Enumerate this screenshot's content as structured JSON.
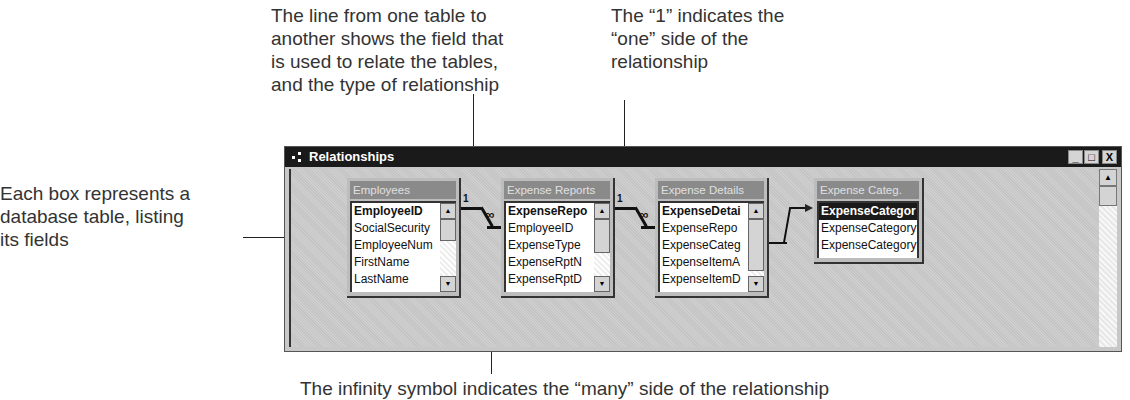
{
  "callouts": {
    "line_field": [
      "The line from one table to",
      "another shows the field that",
      "is used to relate the tables,",
      "and the type of relationship"
    ],
    "one_side": [
      "The “1” indicates the",
      "“one” side of the",
      "relationship"
    ],
    "box_table": [
      "Each box represents a",
      "database table, listing",
      "its fields"
    ],
    "infinity": "The infinity symbol indicates the “many” side of the relationship"
  },
  "window": {
    "title": "Relationships",
    "icon": "relationships-icon",
    "buttons": {
      "minimize": "_",
      "maximize": "□",
      "close": "X"
    }
  },
  "tables": [
    {
      "title": "Employees",
      "fields": [
        "EmployeeID",
        "SocialSecurity",
        "EmployeeNum",
        "FirstName",
        "LastName"
      ]
    },
    {
      "title": "Expense Reports",
      "fields": [
        "ExpenseRepo",
        "EmployeeID",
        "ExpenseType",
        "ExpenseRptN",
        "ExpenseRptD"
      ]
    },
    {
      "title": "Expense Details",
      "fields": [
        "ExpenseDetai",
        "ExpenseRepo",
        "ExpenseCateg",
        "ExpenseItemA",
        "ExpenseItemD"
      ]
    },
    {
      "title": "Expense Categ.",
      "fields": [
        "ExpenseCategor",
        "ExpenseCategory",
        "ExpenseCategory"
      ]
    }
  ],
  "relationships": [
    {
      "one": "1",
      "many": "∞"
    },
    {
      "one": "1",
      "many": "∞"
    }
  ]
}
